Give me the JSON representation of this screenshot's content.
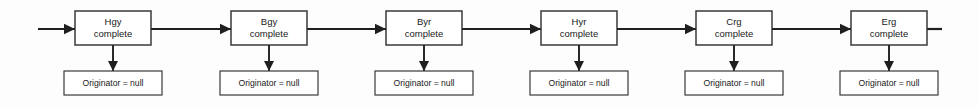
{
  "diagram": {
    "type": "state-transition-chain",
    "orientation": "horizontal",
    "entry_arrow": true,
    "exit_line": true,
    "exit_arrow_head": false,
    "colors": {
      "background": "#fdfdfd",
      "box_fill": "#ffffff",
      "box_stroke": "#2b2b2b",
      "line": "#1f1f1f",
      "text": "#1a1a1a"
    },
    "nodes": [
      {
        "id": "node-1",
        "state_label": "Hgy",
        "status_label": "complete",
        "note_label": "Originator = null",
        "box_x": 75,
        "box_width": 76
      },
      {
        "id": "node-2",
        "state_label": "Bgy",
        "status_label": "complete",
        "note_label": "Originator = null",
        "box_x": 231,
        "box_width": 76
      },
      {
        "id": "node-3",
        "state_label": "Byr",
        "status_label": "complete",
        "note_label": "Originator = null",
        "box_x": 386,
        "box_width": 76
      },
      {
        "id": "node-4",
        "state_label": "Hyr",
        "status_label": "complete",
        "note_label": "Originator = null",
        "box_x": 541,
        "box_width": 76
      },
      {
        "id": "node-5",
        "state_label": "Crg",
        "status_label": "complete",
        "note_label": "Originator = null",
        "box_x": 696,
        "box_width": 76
      },
      {
        "id": "node-6",
        "state_label": "Erg",
        "status_label": "complete",
        "note_label": "Originator = null",
        "box_x": 851,
        "box_width": 76
      }
    ],
    "geometry": {
      "box_y": 11,
      "box_height": 34,
      "note_y": 71,
      "note_height": 24,
      "note_width": 98,
      "center_line_y": 29,
      "entry_line_start_x": 38,
      "exit_line_end_x": 942
    }
  }
}
